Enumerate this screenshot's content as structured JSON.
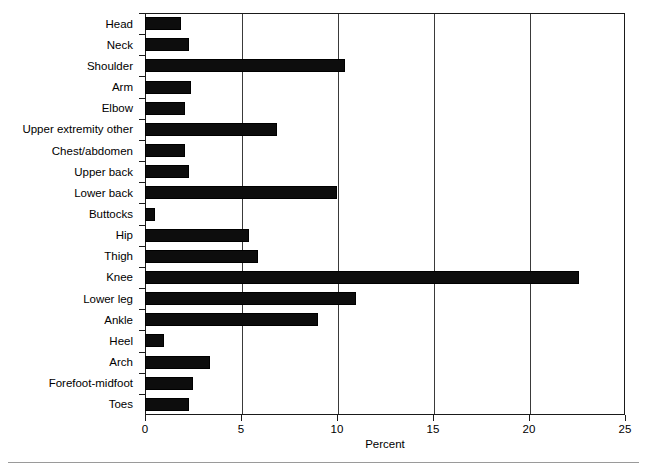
{
  "chart_data": {
    "type": "bar",
    "orientation": "horizontal",
    "title": "",
    "xlabel": "Percent",
    "ylabel": "",
    "xlim": [
      0,
      25
    ],
    "xticks": [
      0,
      5,
      10,
      15,
      20,
      25
    ],
    "xtick_labels": [
      "0",
      "5",
      "10",
      "15",
      "20",
      "25"
    ],
    "grid": "vertical",
    "legend": "none",
    "bar_color": "#0d0d0d",
    "categories": [
      "Head",
      "Neck",
      "Shoulder",
      "Arm",
      "Elbow",
      "Upper extremity other",
      "Chest/abdomen",
      "Upper back",
      "Lower back",
      "Buttocks",
      "Hip",
      "Thigh",
      "Knee",
      "Lower leg",
      "Ankle",
      "Heel",
      "Arch",
      "Forefoot-midfoot",
      "Toes"
    ],
    "values": [
      1.9,
      2.3,
      10.4,
      2.4,
      2.1,
      6.9,
      2.1,
      2.3,
      10.0,
      0.5,
      5.4,
      5.9,
      22.6,
      11.0,
      9.0,
      1.0,
      3.4,
      2.5,
      2.3
    ]
  },
  "axes": {
    "x_title": "Percent"
  }
}
